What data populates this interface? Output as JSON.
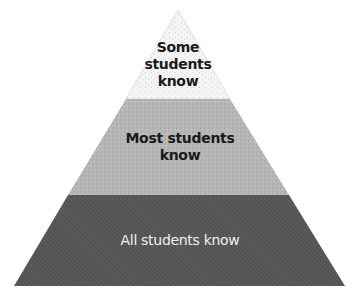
{
  "diagram": {
    "type": "pyramid",
    "layers": [
      {
        "label": "Some\nstudents\nknow",
        "fill": "#f2f2f2",
        "text_color": "#1a1a1a"
      },
      {
        "label": "Most students\nknow",
        "fill": "#b4b4b4",
        "text_color": "#1a1a1a"
      },
      {
        "label": "All students know",
        "fill": "#5a5a5a",
        "text_color": "#f0f0f0"
      }
    ]
  }
}
